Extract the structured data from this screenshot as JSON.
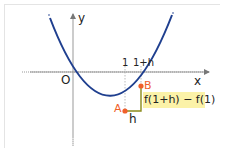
{
  "diagram": {
    "axes": {
      "x_label": "x",
      "y_label": "y",
      "origin_label": "O",
      "x_ticks": [
        "1",
        "1+h"
      ]
    },
    "points": [
      {
        "label": "A",
        "x": "1",
        "y": "f(1)"
      },
      {
        "label": "B",
        "x": "1+h",
        "y": "f(1+h)"
      }
    ],
    "increment_labels": {
      "horizontal": "h",
      "vertical": "f(1+h) − f(1)"
    },
    "colors": {
      "curve": "#1f3f8f",
      "points": "#f0602a",
      "triangle": "#8a8a1a",
      "label_highlight": "#fbf2a8",
      "axes": "#888888"
    }
  }
}
